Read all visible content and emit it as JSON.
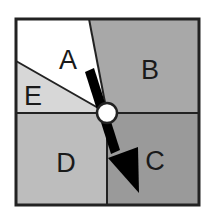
{
  "diagram": {
    "frame": {
      "x": 16,
      "y": 19,
      "width": 183,
      "height": 186,
      "stroke": "#222222"
    },
    "center": {
      "x": 107,
      "y": 113,
      "r": 10,
      "fill": "#ffffff"
    },
    "regions": [
      {
        "id": "A",
        "label": "A",
        "fill": "#ffffff",
        "label_x": 68,
        "label_y": 60,
        "points": "16,19 89,19 107,113 16,61"
      },
      {
        "id": "B",
        "label": "B",
        "fill": "#a8a8a8",
        "label_x": 150,
        "label_y": 70,
        "points": "89,19 199,19 199,113 107,113"
      },
      {
        "id": "C",
        "label": "C",
        "fill": "#9a9a9a",
        "label_x": 155,
        "label_y": 161,
        "points": "107,113 199,113 199,205 107,205"
      },
      {
        "id": "D",
        "label": "D",
        "fill": "#bdbdbd",
        "label_x": 66,
        "label_y": 163,
        "points": "16,113 107,113 107,205 16,205"
      },
      {
        "id": "E",
        "label": "E",
        "fill": "#d7d7d7",
        "label_x": 33,
        "label_y": 96,
        "points": "16,61 107,113 16,113"
      }
    ],
    "arrow": {
      "color": "#000000",
      "shaft": "85,72 94,68 120,150 111,154",
      "head": "108,158 138,147 139,193"
    }
  }
}
